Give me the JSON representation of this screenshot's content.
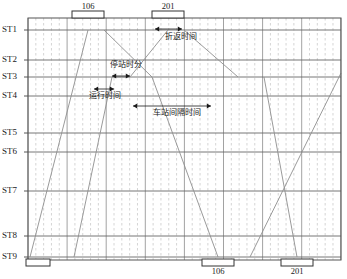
{
  "figure": {
    "kind": "train-working-timetable-diagram"
  },
  "axes": {
    "y_axis_name": "station-axis",
    "x_axis_name": "time-axis",
    "plot": {
      "x": 28,
      "y": 18,
      "width": 313,
      "height": 242
    },
    "grid": {
      "major_vertical_step_px": 39.1,
      "minor_vertical_step_px": 7.82,
      "major_color": "#8a8a8a",
      "minor_color": "#b9b9b9",
      "station_line_color": "#666666",
      "border_color": "#555555"
    }
  },
  "stations": [
    {
      "label": "ST1",
      "y": 30
    },
    {
      "label": "ST2",
      "y": 60
    },
    {
      "label": "ST3",
      "y": 77
    },
    {
      "label": "ST4",
      "y": 96
    },
    {
      "label": "ST5",
      "y": 133
    },
    {
      "label": "ST6",
      "y": 152
    },
    {
      "label": "ST7",
      "y": 191
    },
    {
      "label": "ST8",
      "y": 236
    },
    {
      "label": "ST9",
      "y": 257
    }
  ],
  "train_markers": {
    "top": [
      {
        "number": "106",
        "x": 88,
        "box_x": 72,
        "box_w": 32
      },
      {
        "number": "201",
        "x": 168,
        "box_x": 152,
        "box_w": 32
      }
    ],
    "bottom": [
      {
        "number": "",
        "x": 36,
        "box_x": 26,
        "box_w": 24
      },
      {
        "number": "106",
        "x": 218,
        "box_x": 202,
        "box_w": 32
      },
      {
        "number": "201",
        "x": 297,
        "box_x": 281,
        "box_w": 32
      }
    ]
  },
  "annotations": [
    {
      "id": "turnback-time",
      "label": "折返时间",
      "meaning": "turnback time",
      "text_x": 181,
      "text_y": 39,
      "arrow": {
        "x1": 155,
        "x2": 182,
        "y": 29
      }
    },
    {
      "id": "dwell-time",
      "label": "停站时分",
      "meaning": "dwell time at station",
      "text_x": 126,
      "text_y": 67,
      "arrow": {
        "x1": 112,
        "x2": 130,
        "y": 76
      }
    },
    {
      "id": "running-time",
      "label": "运行时间",
      "meaning": "section running time",
      "text_x": 105,
      "text_y": 98,
      "arrow": {
        "x1": 94,
        "x2": 114,
        "y": 89
      }
    },
    {
      "id": "station-headway",
      "label": "车站间隔时间",
      "meaning": "station interval (headway) time",
      "text_x": 177,
      "text_y": 115,
      "arrow": {
        "x1": 133,
        "x2": 211,
        "y": 106
      }
    }
  ],
  "chart_data": {
    "type": "line",
    "title": "",
    "xlabel": "",
    "ylabel": "",
    "categories": [
      "ST1",
      "ST2",
      "ST3",
      "ST4",
      "ST5",
      "ST6",
      "ST7",
      "ST8",
      "ST9"
    ],
    "grid": true,
    "legend_position": "none",
    "line_color": "#8f8f8f",
    "series": [
      {
        "name": "train-path-1-upline",
        "comment": "departs ST9 bottom-left, climbs to ST1 where train 106 turns back",
        "points": [
          [
            30,
            257
          ],
          [
            88,
            30
          ]
        ]
      },
      {
        "name": "train-path-1-downline",
        "comment": "train 106 from ST1 descends through dwell step at ST3 then to ST9",
        "points": [
          [
            104,
            30
          ],
          [
            152,
            77
          ],
          [
            218,
            257
          ]
        ]
      },
      {
        "name": "train-path-2-upline",
        "comment": "second up train climbing from ST9 to ST1, includes dwell step at ST3",
        "points": [
          [
            74,
            257
          ],
          [
            112,
            77
          ],
          [
            130,
            77
          ],
          [
            168,
            30
          ]
        ]
      },
      {
        "name": "train-path-2-downline",
        "comment": "train 201 from ST1 descending to ST3 area and beyond",
        "points": [
          [
            184,
            30
          ],
          [
            238,
            77
          ]
        ]
      },
      {
        "name": "train-path-3-upline",
        "comment": "later up train entering from lower right of plot",
        "points": [
          [
            250,
            257
          ],
          [
            341,
            73
          ]
        ]
      },
      {
        "name": "train-path-3-downline",
        "comment": "later down train from ST3 right side heading to ST9 bottom right",
        "points": [
          [
            264,
            77
          ],
          [
            297,
            257
          ]
        ]
      }
    ]
  },
  "colors": {
    "background": "#ffffff",
    "plot_background": "#ffffff",
    "train_line": "#8f8f8f",
    "text": "#1a1a1a",
    "marker_box_fill": "#ffffff",
    "marker_box_stroke": "#333333"
  }
}
